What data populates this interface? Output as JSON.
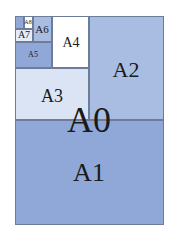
{
  "diagram": {
    "title": "",
    "sheets": [
      {
        "id": "A1",
        "label": "A1",
        "x": 15,
        "y": 120,
        "w": 149,
        "h": 105,
        "color": "#8fa8d8",
        "font": 26,
        "lx": 89,
        "ly": 173
      },
      {
        "id": "A2",
        "label": "A2",
        "x": 89,
        "y": 16,
        "w": 75,
        "h": 104,
        "color": "#a9bde3",
        "font": 22,
        "lx": 126,
        "ly": 70
      },
      {
        "id": "A3",
        "label": "A3",
        "x": 15,
        "y": 68,
        "w": 74,
        "h": 52,
        "color": "#dbe4f4",
        "font": 18,
        "lx": 52,
        "ly": 96
      },
      {
        "id": "A4",
        "label": "A4",
        "x": 52,
        "y": 16,
        "w": 37,
        "h": 52,
        "color": "#ffffff",
        "font": 14,
        "lx": 71,
        "ly": 43
      },
      {
        "id": "A5",
        "label": "A5",
        "x": 15,
        "y": 42,
        "w": 37,
        "h": 26,
        "color": "#8fa8d8",
        "font": 8,
        "lx": 33,
        "ly": 55
      },
      {
        "id": "A6",
        "label": "A6",
        "x": 33,
        "y": 16,
        "w": 19,
        "h": 26,
        "color": "#a9bde3",
        "font": 11,
        "lx": 42,
        "ly": 29
      },
      {
        "id": "A7",
        "label": "A7",
        "x": 15,
        "y": 29,
        "w": 18,
        "h": 13,
        "color": "#e6ecf7",
        "font": 10,
        "lx": 24,
        "ly": 35
      },
      {
        "id": "A8",
        "label": "A8",
        "x": 24,
        "y": 16,
        "w": 9,
        "h": 13,
        "color": "#ffffff",
        "font": 6,
        "lx": 28,
        "ly": 22
      },
      {
        "id": "A9",
        "label": "",
        "x": 15,
        "y": 16,
        "w": 9,
        "h": 13,
        "color": "#8fa8d8",
        "font": 5,
        "lx": 19,
        "ly": 22
      }
    ],
    "overall": {
      "label": "A0",
      "x": 15,
      "y": 16,
      "w": 149,
      "h": 209,
      "font": 36,
      "lx": 89,
      "ly": 120,
      "border": "#6d7c99"
    }
  }
}
